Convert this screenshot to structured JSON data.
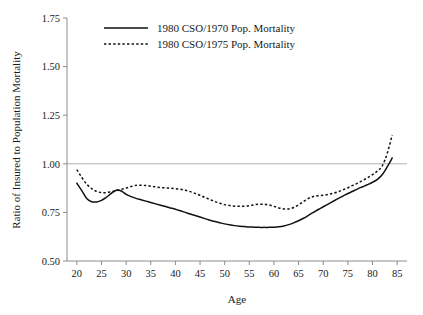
{
  "chart_data": {
    "type": "line",
    "title": "",
    "xlabel": "Age",
    "ylabel": "Ratio of Insured to Population Mortality",
    "xlim": [
      18,
      87
    ],
    "ylim": [
      0.5,
      1.75
    ],
    "xticks": [
      20,
      25,
      30,
      35,
      40,
      45,
      50,
      55,
      60,
      65,
      70,
      75,
      80,
      85
    ],
    "yticks": [
      0.5,
      0.75,
      1.0,
      1.25,
      1.5,
      1.75
    ],
    "xtick_labels": [
      "20",
      "25",
      "30",
      "35",
      "40",
      "45",
      "50",
      "55",
      "60",
      "65",
      "70",
      "75",
      "80",
      "85"
    ],
    "ytick_labels": [
      "0.50",
      "0.75",
      "1.00",
      "1.25",
      "1.50",
      "1.75"
    ],
    "grid": false,
    "reference_lines": [
      {
        "axis": "y",
        "value": 1.0,
        "color": "#b0b0b0",
        "name": "unity-reference-line"
      }
    ],
    "legend_position": "top-center",
    "x": [
      20,
      21,
      22,
      23,
      24,
      25,
      26,
      27,
      28,
      29,
      30,
      31,
      32,
      33,
      34,
      35,
      36,
      37,
      38,
      39,
      40,
      41,
      42,
      43,
      44,
      45,
      46,
      47,
      48,
      49,
      50,
      51,
      52,
      53,
      54,
      55,
      56,
      57,
      58,
      59,
      60,
      61,
      62,
      63,
      64,
      65,
      66,
      67,
      68,
      69,
      70,
      71,
      72,
      73,
      74,
      75,
      76,
      77,
      78,
      79,
      80,
      81,
      82,
      83,
      84
    ],
    "series": [
      {
        "name": "1980 CSO/1970 Pop. Mortality",
        "style": "solid",
        "color": "#111111",
        "values": [
          0.9,
          0.862,
          0.822,
          0.805,
          0.804,
          0.812,
          0.828,
          0.848,
          0.864,
          0.86,
          0.843,
          0.831,
          0.822,
          0.815,
          0.808,
          0.801,
          0.794,
          0.787,
          0.78,
          0.773,
          0.766,
          0.758,
          0.75,
          0.742,
          0.734,
          0.726,
          0.718,
          0.71,
          0.703,
          0.697,
          0.691,
          0.686,
          0.682,
          0.679,
          0.677,
          0.675,
          0.674,
          0.673,
          0.673,
          0.673,
          0.674,
          0.676,
          0.68,
          0.687,
          0.696,
          0.707,
          0.72,
          0.735,
          0.75,
          0.765,
          0.779,
          0.793,
          0.807,
          0.821,
          0.834,
          0.847,
          0.859,
          0.871,
          0.882,
          0.893,
          0.905,
          0.92,
          0.945,
          0.985,
          1.03
        ]
      },
      {
        "name": "1980 CSO/1975 Pop. Mortality",
        "style": "dashed",
        "color": "#111111",
        "values": [
          0.97,
          0.93,
          0.895,
          0.872,
          0.858,
          0.852,
          0.852,
          0.857,
          0.862,
          0.868,
          0.875,
          0.883,
          0.889,
          0.89,
          0.888,
          0.885,
          0.881,
          0.878,
          0.876,
          0.874,
          0.872,
          0.869,
          0.864,
          0.857,
          0.848,
          0.838,
          0.827,
          0.816,
          0.806,
          0.797,
          0.79,
          0.785,
          0.782,
          0.781,
          0.782,
          0.785,
          0.789,
          0.792,
          0.792,
          0.788,
          0.781,
          0.773,
          0.768,
          0.768,
          0.775,
          0.789,
          0.806,
          0.822,
          0.832,
          0.836,
          0.838,
          0.842,
          0.848,
          0.856,
          0.866,
          0.877,
          0.889,
          0.901,
          0.914,
          0.928,
          0.944,
          0.963,
          0.99,
          1.055,
          1.148
        ]
      }
    ],
    "legend": [
      {
        "label": "1980 CSO/1970 Pop. Mortality",
        "style": "solid"
      },
      {
        "label": "1980 CSO/1975 Pop. Mortality",
        "style": "dashed"
      }
    ]
  },
  "geometry": {
    "plot_left": 67,
    "plot_right": 407,
    "plot_top": 18,
    "plot_bottom": 261
  }
}
